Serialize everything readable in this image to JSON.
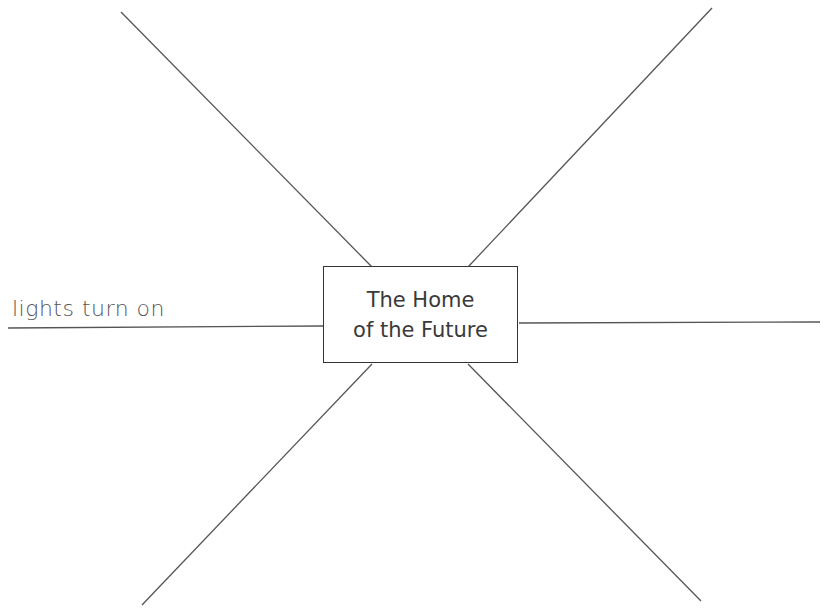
{
  "diagram": {
    "type": "spider-map",
    "center": {
      "line1": "The Home",
      "line2": "of the Future"
    },
    "spokes": [
      {
        "position": "left",
        "label": "lights turn on"
      },
      {
        "position": "right",
        "label": ""
      },
      {
        "position": "top-left",
        "label": ""
      },
      {
        "position": "top-right",
        "label": ""
      },
      {
        "position": "bottom-left",
        "label": ""
      },
      {
        "position": "bottom-right",
        "label": ""
      }
    ],
    "colors": {
      "line": "#555555",
      "text": "#3a3a3a",
      "background": "#ffffff"
    }
  }
}
